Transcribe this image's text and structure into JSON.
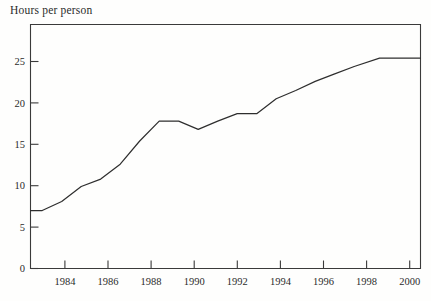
{
  "chart_data": {
    "type": "line",
    "title": "Hours per person",
    "xlabel": "",
    "ylabel": "Hours per person",
    "grid": false,
    "legend": false,
    "xlim": [
      1982.4,
      2002.4
    ],
    "ylim": [
      0,
      29.5
    ],
    "yticks": [
      0,
      5,
      10,
      15,
      20,
      25
    ],
    "ytick_labels": [
      "0",
      "5",
      "10",
      "15",
      "20",
      "25"
    ],
    "xticks": [
      1984,
      1986,
      1988,
      1990,
      1992,
      1994,
      1996,
      1998,
      2000
    ],
    "xtick_labels": [
      "1984",
      "1986",
      "1988",
      "1990",
      "1992",
      "1994",
      "1996",
      "1998",
      "2000"
    ],
    "x": [
      1982.4,
      1983.0,
      1984.0,
      1985.0,
      1986.0,
      1987.0,
      1988.0,
      1989.0,
      1990.0,
      1991.0,
      1992.0,
      1993.0,
      1994.0,
      1995.0,
      1996.0,
      1997.0,
      1998.0,
      1999.0,
      2000.3,
      2002.4
    ],
    "values": [
      7.0,
      7.0,
      8.1,
      9.9,
      10.8,
      12.6,
      15.4,
      17.8,
      17.8,
      16.8,
      17.8,
      18.7,
      18.7,
      20.5,
      21.5,
      22.6,
      23.5,
      24.4,
      25.4,
      25.4
    ],
    "series": [
      {
        "name": "Hours per person",
        "color": "#2e2e2e",
        "points": [
          {
            "year": 1982.4,
            "value": 7.0
          },
          {
            "year": 1983.0,
            "value": 7.0
          },
          {
            "year": 1984.0,
            "value": 8.1
          },
          {
            "year": 1985.0,
            "value": 9.9
          },
          {
            "year": 1986.0,
            "value": 10.8
          },
          {
            "year": 1987.0,
            "value": 12.6
          },
          {
            "year": 1988.0,
            "value": 15.4
          },
          {
            "year": 1989.0,
            "value": 17.8
          },
          {
            "year": 1990.0,
            "value": 17.8
          },
          {
            "year": 1991.0,
            "value": 16.8
          },
          {
            "year": 1992.0,
            "value": 17.8
          },
          {
            "year": 1993.0,
            "value": 18.7
          },
          {
            "year": 1994.0,
            "value": 18.7
          },
          {
            "year": 1995.0,
            "value": 20.5
          },
          {
            "year": 1996.0,
            "value": 21.5
          },
          {
            "year": 1997.0,
            "value": 22.6
          },
          {
            "year": 1998.0,
            "value": 23.5
          },
          {
            "year": 1999.0,
            "value": 24.4
          },
          {
            "year": 2000.3,
            "value": 25.4
          },
          {
            "year": 2002.4,
            "value": 25.4
          }
        ]
      }
    ]
  },
  "colors": {
    "line": "#2e2e2e",
    "axis": "#3a3a3a",
    "text": "#2b2b2b",
    "background": "#fefefd"
  }
}
